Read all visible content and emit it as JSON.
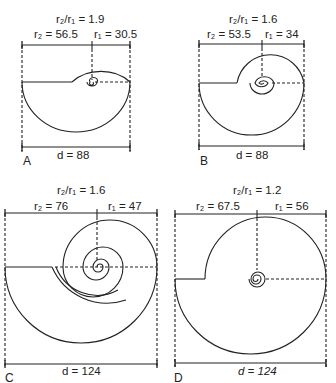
{
  "figure": {
    "panels": [
      {
        "id": "A",
        "letter": "A",
        "ratio_label": "r₂/r₁ = 1.9",
        "r2_label": "r₂ = 56.5",
        "r1_label": "r₁ = 30.5",
        "d_label": "d = 88",
        "ratio": 1.9,
        "r2": 56.5,
        "r1": 30.5,
        "d": 88
      },
      {
        "id": "B",
        "letter": "B",
        "ratio_label": "r₂/r₁ = 1.6",
        "r2_label": "r₂ = 53.5",
        "r1_label": "r₁ = 34",
        "d_label": "d = 88",
        "ratio": 1.6,
        "r2": 53.5,
        "r1": 34,
        "d": 88
      },
      {
        "id": "C",
        "letter": "C",
        "ratio_label": "r₂/r₁ = 1.6",
        "r2_label": "r₂ = 76",
        "r1_label": "r₁ = 47",
        "d_label": "d = 124",
        "ratio": 1.6,
        "r2": 76,
        "r1": 47,
        "d": 124
      },
      {
        "id": "D",
        "letter": "D",
        "ratio_label": "r₂/r₁ = 1.2",
        "r2_label": "r₂ = 67.5",
        "r1_label": "r₁ = 56",
        "d_label": "d = 124",
        "ratio": 1.2,
        "r2": 67.5,
        "r1": 56,
        "d": 124
      }
    ],
    "colors": {
      "line": "#222222",
      "background": "#ffffff"
    }
  }
}
